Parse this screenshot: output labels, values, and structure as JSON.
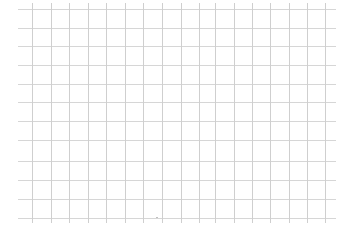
{
  "canvas": {
    "width": 348,
    "height": 240,
    "background": "#ffffff"
  },
  "grid": {
    "horizontal_color": "#d6d6d6",
    "vertical_color": "#cfcfcf",
    "horizontal_lines": {
      "x_start": 18,
      "x_end": 336,
      "y_positions": [
        9,
        28,
        46,
        65,
        84,
        102,
        121,
        140,
        161,
        180,
        199,
        218
      ]
    },
    "vertical_lines": {
      "y_start": 3,
      "y_end": 223,
      "x_positions": [
        32,
        51,
        69,
        88,
        106,
        125,
        143,
        162,
        181,
        199,
        215,
        234,
        252,
        270,
        289,
        307,
        325
      ]
    }
  },
  "artifacts": [
    {
      "x": 156,
      "y": 217,
      "color": "#b8b8b8"
    }
  ]
}
